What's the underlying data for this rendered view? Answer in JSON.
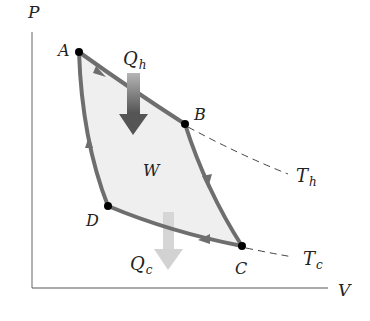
{
  "axes": {
    "y_label": "P",
    "x_label": "V"
  },
  "points": [
    {
      "label": "A",
      "x": 79,
      "y": 52,
      "lx": 58,
      "ly": 55
    },
    {
      "label": "B",
      "x": 185,
      "y": 124,
      "lx": 194,
      "ly": 119
    },
    {
      "label": "C",
      "x": 242,
      "y": 246,
      "lx": 236,
      "ly": 274
    },
    {
      "label": "D",
      "x": 108,
      "y": 206,
      "lx": 86,
      "ly": 225
    }
  ],
  "labels": {
    "heat_in": "Q",
    "heat_in_sub": "h",
    "heat_out": "Q",
    "heat_out_sub": "c",
    "work": "W",
    "hot_isotherm": "T",
    "hot_isotherm_sub": "h",
    "cold_isotherm": "T",
    "cold_isotherm_sub": "c"
  },
  "colors": {
    "cycle_stroke": "#6e6e6e",
    "cycle_fill": "#efefef",
    "point": "#000000",
    "axis": "#555555",
    "isotherm_dash": "#444444",
    "qh_arrow_top": "#a8a8a8",
    "qh_arrow_bottom": "#555555",
    "qc_arrow": "#d4d4d4"
  }
}
